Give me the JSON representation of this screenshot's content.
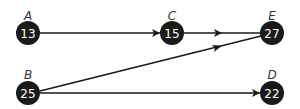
{
  "diagram": {
    "type": "directed-graph",
    "colors": {
      "node_fill": "#1a1a1a",
      "node_text": "#ffffff",
      "edge": "#1a1a1a",
      "label": "#333333",
      "background": "#ffffff"
    },
    "nodes": [
      {
        "id": "A",
        "label": "A",
        "value": "13",
        "x": 28,
        "y": 33
      },
      {
        "id": "C",
        "label": "C",
        "value": "15",
        "x": 172,
        "y": 33
      },
      {
        "id": "E",
        "label": "E",
        "value": "27",
        "x": 272,
        "y": 33
      },
      {
        "id": "B",
        "label": "B",
        "value": "25",
        "x": 28,
        "y": 93
      },
      {
        "id": "D",
        "label": "D",
        "value": "22",
        "x": 272,
        "y": 93
      }
    ],
    "edges": [
      {
        "from": "A",
        "to": "C",
        "arrow": "end"
      },
      {
        "from": "C",
        "to": "E",
        "arrow": "middle"
      },
      {
        "from": "B",
        "to": "E",
        "arrow": "middle"
      },
      {
        "from": "B",
        "to": "D",
        "arrow": "end"
      }
    ]
  }
}
